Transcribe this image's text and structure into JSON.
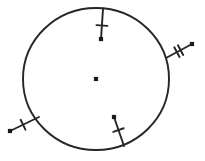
{
  "figure": {
    "type": "geometry-diagram",
    "background_color": "#ffffff",
    "stroke_color": "#262626",
    "dot_color": "#1a1a1a",
    "canvas": {
      "width": 205,
      "height": 161
    }
  },
  "circle": {
    "label": "circle-outline",
    "center_x": 96,
    "center_y": 79,
    "radius_x": 73,
    "radius_y": 71,
    "stroke_width": 1.9
  },
  "center_point": {
    "label": "center-point",
    "x": 96,
    "y": 79,
    "size": 4.2
  },
  "segments": [
    {
      "label": "segment-top",
      "direction": "inward",
      "tick_count": 1,
      "from_x": 103,
      "from_y": 9,
      "to_x": 101,
      "to_y": 39,
      "tick_positions": [
        0.55
      ],
      "tick_length": 11,
      "endpoint_dot": true,
      "endpoint_dot_size": 4.2,
      "stroke_width": 1.9
    },
    {
      "label": "segment-right",
      "direction": "outward",
      "tick_count": 2,
      "from_x": 166,
      "from_y": 58,
      "to_x": 192,
      "to_y": 44,
      "tick_positions": [
        0.42,
        0.56
      ],
      "tick_length": 11,
      "endpoint_dot": true,
      "endpoint_dot_size": 4.2,
      "stroke_width": 1.9
    },
    {
      "label": "segment-bottom-left",
      "direction": "outward",
      "tick_count": 1,
      "from_x": 39,
      "from_y": 117,
      "to_x": 10,
      "to_y": 131,
      "tick_positions": [
        0.55
      ],
      "tick_length": 11,
      "endpoint_dot": true,
      "endpoint_dot_size": 4.2,
      "stroke_width": 1.9
    },
    {
      "label": "segment-bottom-center",
      "direction": "inward",
      "tick_count": 1,
      "from_x": 124,
      "from_y": 146,
      "to_x": 114,
      "to_y": 117,
      "tick_positions": [
        0.55
      ],
      "tick_length": 11,
      "endpoint_dot": true,
      "endpoint_dot_size": 4.2,
      "stroke_width": 1.9
    }
  ]
}
